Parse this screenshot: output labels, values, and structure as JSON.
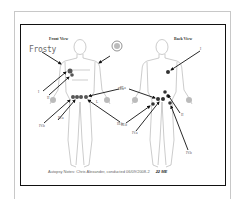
{
  "document": {
    "front_title": "Front View",
    "back_title": "Back View",
    "handwritten_label": "Frosty",
    "seal_icon": "official-seal-icon",
    "wound_labels": {
      "front": [
        "I",
        "II",
        "III.a",
        "IV.b",
        "IV.a",
        "III.b",
        "L"
      ],
      "back": [
        "I",
        "III.a",
        "III.b",
        "IV.a",
        "II",
        "IV.b"
      ]
    },
    "footer_text": "Autopsy Notes: Chris Alexander, conducted 06/09/2008-2",
    "footer_time": "22 ME"
  }
}
